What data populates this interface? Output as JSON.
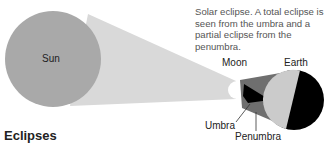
{
  "caption": "Solar eclipse. A total eclipse is seen from the umbra and a partial eclipse from the penumbra.",
  "labels": {
    "sun": "Sun",
    "moon": "Moon",
    "earth": "Earth",
    "umbra": "Umbra",
    "penumbra": "Penumbra"
  },
  "section_title": "Eclipses",
  "colors": {
    "sun": "#a9a9a9",
    "light_cone": "#d9d9d9",
    "moon": "#ffffff",
    "penumbra": "#6f6f6f",
    "umbra": "#000000",
    "earth_day": "#cbcbcb",
    "earth_night": "#000000"
  }
}
